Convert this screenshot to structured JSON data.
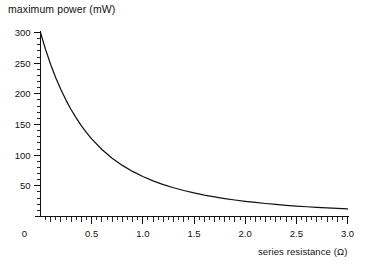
{
  "chart_data": {
    "type": "line",
    "title": "",
    "xlabel": "series resistance (Ω)",
    "ylabel": "maximum power (mW)",
    "xlim": [
      0,
      3.0
    ],
    "ylim": [
      0,
      300
    ],
    "grid": false,
    "legend": null,
    "x_major_ticks": [
      0,
      0.5,
      1.0,
      1.5,
      2.0,
      2.5,
      3.0
    ],
    "x_tick_labels": [
      "0",
      "0.5",
      "1.0",
      "1.5",
      "2.0",
      "2.5",
      "3.0"
    ],
    "x_minor_tick_step": 0.05,
    "y_major_ticks": [
      50,
      100,
      150,
      200,
      250,
      300
    ],
    "y_tick_labels": [
      "50",
      "100",
      "150",
      "200",
      "250",
      "300"
    ],
    "y_minor_tick_step": 10,
    "series": [
      {
        "name": "maximum power",
        "color": "#111111",
        "x": [
          0.0,
          0.05,
          0.1,
          0.15,
          0.2,
          0.25,
          0.3,
          0.35,
          0.4,
          0.45,
          0.5,
          0.6,
          0.7,
          0.8,
          0.9,
          1.0,
          1.1,
          1.2,
          1.3,
          1.4,
          1.5,
          1.6,
          1.7,
          1.8,
          1.9,
          2.0,
          2.1,
          2.2,
          2.3,
          2.4,
          2.5,
          2.6,
          2.7,
          2.8,
          2.9,
          3.0
        ],
        "y": [
          300.0,
          272.0,
          247.5,
          225.9,
          206.6,
          189.4,
          174.1,
          160.3,
          147.9,
          136.7,
          126.6,
          109.3,
          95.1,
          83.3,
          73.5,
          65.2,
          58.1,
          52.1,
          46.9,
          42.4,
          38.4,
          35.0,
          32.0,
          29.3,
          26.9,
          24.8,
          22.9,
          21.2,
          19.7,
          18.3,
          17.0,
          15.9,
          14.9,
          13.9,
          13.1,
          12.3
        ]
      }
    ],
    "annotations": []
  }
}
